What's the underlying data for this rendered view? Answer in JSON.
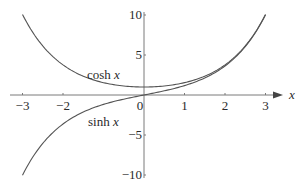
{
  "chart_data": {
    "type": "line",
    "title": "",
    "xlabel": "x",
    "ylabel": "",
    "xlim": [
      -3,
      3
    ],
    "ylim": [
      -10,
      10
    ],
    "grid": false,
    "legend": "none (inline curve labels)",
    "x_ticks": [
      -3,
      -2,
      0,
      1,
      2,
      3
    ],
    "x_tick_labels": [
      "−3",
      "−2",
      "0",
      "1",
      "2",
      "3"
    ],
    "y_ticks": [
      10,
      5,
      -5,
      -10
    ],
    "y_tick_labels": [
      "10",
      "5",
      "−5",
      "−10"
    ],
    "series": [
      {
        "name": "cosh x",
        "label_main": "cosh ",
        "label_var": "x",
        "function": "cosh",
        "x": [
          -3,
          -2.5,
          -2,
          -1.5,
          -1,
          -0.5,
          0,
          0.5,
          1,
          1.5,
          2,
          2.5,
          3
        ],
        "y": [
          10.07,
          6.13,
          3.76,
          2.35,
          1.54,
          1.13,
          1.0,
          1.13,
          1.54,
          2.35,
          3.76,
          6.13,
          10.07
        ]
      },
      {
        "name": "sinh x",
        "label_main": "sinh ",
        "label_var": "x",
        "function": "sinh",
        "x": [
          -3,
          -2.5,
          -2,
          -1.5,
          -1,
          -0.5,
          0,
          0.5,
          1,
          1.5,
          2,
          2.5,
          3
        ],
        "y": [
          -10.02,
          -6.05,
          -3.63,
          -2.13,
          -1.18,
          -0.52,
          0.0,
          0.52,
          1.18,
          2.13,
          3.63,
          6.05,
          10.02
        ]
      }
    ],
    "annotations": [
      {
        "text": "cosh x",
        "near": [
          -1.3,
          2.3
        ]
      },
      {
        "text": "sinh x",
        "near": [
          -1.3,
          -2.3
        ]
      }
    ]
  },
  "axis_labels": {
    "x": "x"
  }
}
